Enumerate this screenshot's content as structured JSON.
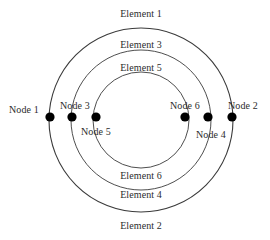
{
  "figure": {
    "type": "concentric-ring-mesh-diagram",
    "canvas": {
      "width": 270,
      "height": 240,
      "background": "#ffffff"
    },
    "center": {
      "x": 141,
      "y": 120
    },
    "stroke_color": "#3a3a3a",
    "node_color": "#000000",
    "text_color": "#2b2b2b"
  },
  "circles": [
    {
      "name": "outer-circle",
      "element": "Element 1 / Element 2",
      "radius": 92,
      "stroke_width": 1.1
    },
    {
      "name": "middle-circle",
      "element": "Element 3 / Element 4",
      "radius": 70,
      "stroke_width": 0.9
    },
    {
      "name": "inner-circle",
      "element": "Element 5 / Element 6",
      "radius": 48,
      "stroke_width": 0.9
    }
  ],
  "elements": [
    {
      "id": "element-1",
      "label": "Element 1",
      "x": 141,
      "y": 8,
      "ring": "outer",
      "side": "top"
    },
    {
      "id": "element-3",
      "label": "Element 3",
      "x": 141,
      "y": 39,
      "ring": "middle",
      "side": "top"
    },
    {
      "id": "element-5",
      "label": "Element 5",
      "x": 141,
      "y": 62,
      "ring": "inner",
      "side": "top"
    },
    {
      "id": "element-6",
      "label": "Element 6",
      "x": 141,
      "y": 170,
      "ring": "inner",
      "side": "bottom"
    },
    {
      "id": "element-4",
      "label": "Element 4",
      "x": 141,
      "y": 189,
      "ring": "middle",
      "side": "bottom"
    },
    {
      "id": "element-2",
      "label": "Element 2",
      "x": 141,
      "y": 220,
      "ring": "outer",
      "side": "bottom"
    }
  ],
  "nodes": [
    {
      "id": "node-1",
      "label": "Node 1",
      "cx": 50,
      "cy": 117,
      "r": 4.6,
      "label_x": 9,
      "label_y": 104
    },
    {
      "id": "node-3",
      "label": "Node 3",
      "cx": 72,
      "cy": 117,
      "r": 4.6,
      "label_x": 60,
      "label_y": 100
    },
    {
      "id": "node-5",
      "label": "Node 5",
      "cx": 96,
      "cy": 117,
      "r": 4.6,
      "label_x": 81,
      "label_y": 126
    },
    {
      "id": "node-6",
      "label": "Node 6",
      "cx": 185,
      "cy": 117,
      "r": 4.6,
      "label_x": 170,
      "label_y": 100
    },
    {
      "id": "node-4",
      "label": "Node 4",
      "cx": 208,
      "cy": 117,
      "r": 4.6,
      "label_x": 196,
      "label_y": 129
    },
    {
      "id": "node-2",
      "label": "Node 2",
      "cx": 232,
      "cy": 117,
      "r": 4.6,
      "label_x": 228,
      "label_y": 100
    }
  ]
}
